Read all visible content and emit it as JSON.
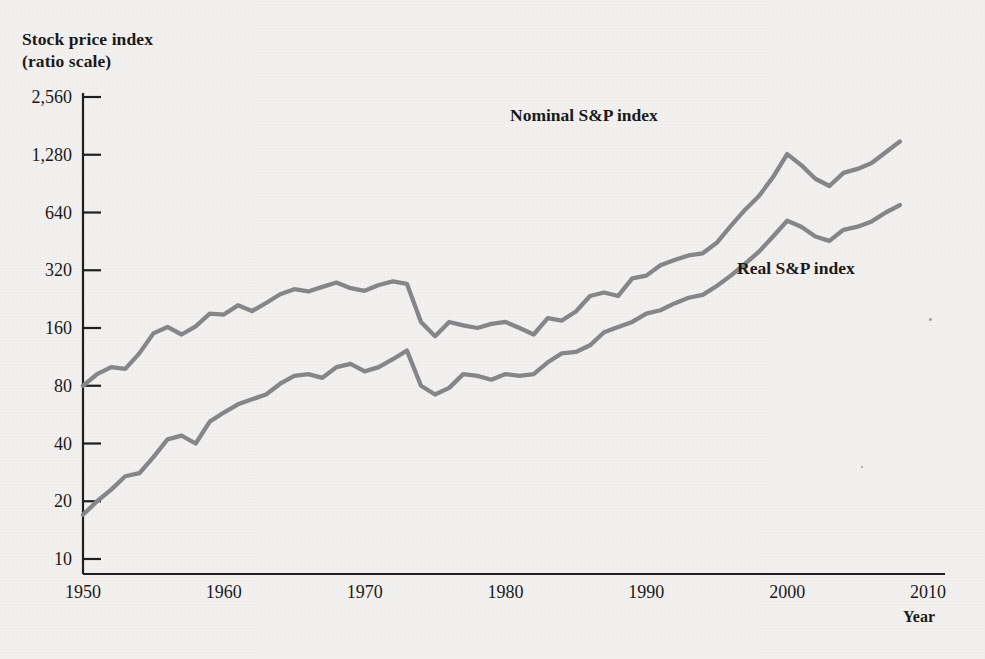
{
  "figure": {
    "background_color": "#f3f1ef",
    "line_color": "#85858a",
    "axis_color": "#1f1f1f",
    "text_color": "#1a1a1a"
  },
  "axes": {
    "y_title_line1": "Stock price index",
    "y_title_line2": "(ratio scale)",
    "x_title": "Year",
    "y_ticks": [
      "2,560",
      "1,280",
      "640",
      "320",
      "160",
      "80",
      "40",
      "20",
      "10"
    ],
    "x_ticks": [
      "1950",
      "1960",
      "1970",
      "1980",
      "1990",
      "2000",
      "2010"
    ]
  },
  "labels": {
    "nominal": "Nominal S&P index",
    "real": "Real S&P index"
  },
  "chart_data": {
    "type": "line",
    "xlabel": "Year",
    "ylabel": "Stock price index (ratio scale)",
    "yscale": "log",
    "ylim": [
      10,
      2560
    ],
    "xlim": [
      1950,
      2010
    ],
    "ytick_values": [
      10,
      20,
      40,
      80,
      160,
      320,
      640,
      1280,
      2560
    ],
    "xtick_values": [
      1950,
      1960,
      1970,
      1980,
      1990,
      2000,
      2010
    ],
    "grid": false,
    "legend_position": "inline-annotation",
    "x": [
      1950,
      1951,
      1952,
      1953,
      1954,
      1955,
      1956,
      1957,
      1958,
      1959,
      1960,
      1961,
      1962,
      1963,
      1964,
      1965,
      1966,
      1967,
      1968,
      1969,
      1970,
      1971,
      1972,
      1973,
      1974,
      1975,
      1976,
      1977,
      1978,
      1979,
      1980,
      1981,
      1982,
      1983,
      1984,
      1985,
      1986,
      1987,
      1988,
      1989,
      1990,
      1991,
      1992,
      1993,
      1994,
      1995,
      1996,
      1997,
      1998,
      1999,
      2000,
      2001,
      2002,
      2003,
      2004,
      2005,
      2006,
      2007,
      2008
    ],
    "series": [
      {
        "name": "Nominal S&P index",
        "values": [
          80,
          92,
          100,
          98,
          118,
          150,
          162,
          148,
          163,
          190,
          188,
          210,
          196,
          216,
          240,
          255,
          248,
          262,
          276,
          258,
          250,
          268,
          280,
          272,
          172,
          145,
          172,
          165,
          160,
          168,
          172,
          160,
          148,
          180,
          175,
          195,
          235,
          245,
          235,
          290,
          300,
          340,
          362,
          382,
          392,
          445,
          545,
          660,
          780,
          980,
          1290,
          1130,
          960,
          880,
          1030,
          1080,
          1160,
          1320,
          1500
        ]
      },
      {
        "name": "Real S&P index",
        "values": [
          17,
          20,
          23,
          27,
          28,
          34,
          42,
          44,
          40,
          52,
          58,
          64,
          68,
          72,
          82,
          90,
          92,
          88,
          100,
          104,
          95,
          100,
          110,
          122,
          80,
          72,
          78,
          92,
          90,
          86,
          92,
          90,
          92,
          106,
          118,
          120,
          130,
          152,
          162,
          172,
          190,
          198,
          215,
          230,
          238,
          265,
          300,
          345,
          400,
          480,
          580,
          540,
          480,
          455,
          520,
          540,
          575,
          640,
          700
        ]
      }
    ],
    "annotations": [
      {
        "text": "Nominal S&P index",
        "x": 1984,
        "y": 1150
      },
      {
        "text": "Real S&P index",
        "x": 1994,
        "y": 300
      }
    ]
  }
}
